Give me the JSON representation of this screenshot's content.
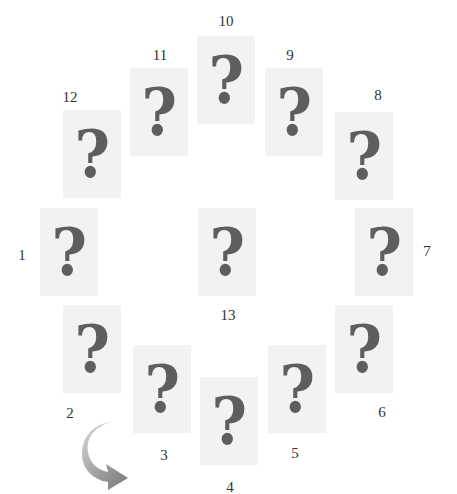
{
  "figure": {
    "card_glyph": "?",
    "card_color": "#f2f2f2",
    "glyph_color": "#5e5e5e",
    "arrow_icon": "curved-arrow-clockwise-icon",
    "cards": [
      {
        "number": "1",
        "x": 40,
        "y": 208,
        "label_x": 22,
        "label_y": 248
      },
      {
        "number": "2",
        "x": 63,
        "y": 305,
        "label_x": 70,
        "label_y": 406
      },
      {
        "number": "3",
        "x": 133,
        "y": 345,
        "label_x": 164,
        "label_y": 448
      },
      {
        "number": "4",
        "x": 200,
        "y": 377,
        "label_x": 230,
        "label_y": 480
      },
      {
        "number": "5",
        "x": 268,
        "y": 345,
        "label_x": 295,
        "label_y": 446
      },
      {
        "number": "6",
        "x": 335,
        "y": 305,
        "label_x": 382,
        "label_y": 405
      },
      {
        "number": "7",
        "x": 355,
        "y": 208,
        "label_x": 427,
        "label_y": 244
      },
      {
        "number": "8",
        "x": 335,
        "y": 112,
        "label_x": 378,
        "label_y": 88
      },
      {
        "number": "9",
        "x": 265,
        "y": 68,
        "label_x": 290,
        "label_y": 48
      },
      {
        "number": "10",
        "x": 197,
        "y": 36,
        "label_x": 226,
        "label_y": 14
      },
      {
        "number": "11",
        "x": 130,
        "y": 68,
        "label_x": 160,
        "label_y": 48
      },
      {
        "number": "12",
        "x": 63,
        "y": 110,
        "label_x": 70,
        "label_y": 90
      },
      {
        "number": "13",
        "x": 198,
        "y": 208,
        "label_x": 228,
        "label_y": 308
      }
    ]
  }
}
